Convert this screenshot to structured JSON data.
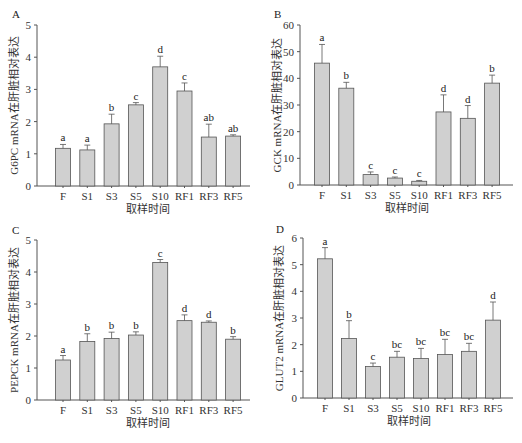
{
  "chart_data": [
    {
      "type": "bar",
      "panel": "A",
      "ylabel": "G6PC mRNA在肝脏相对表达",
      "xlabel": "取样时间",
      "ylim": [
        0,
        5
      ],
      "yticks": [
        0,
        1,
        2,
        3,
        4,
        5
      ],
      "categories": [
        "F",
        "S1",
        "S3",
        "S5",
        "S10",
        "RF1",
        "RF3",
        "RF5"
      ],
      "values": [
        1.17,
        1.12,
        1.93,
        2.52,
        3.7,
        2.95,
        1.52,
        1.55
      ],
      "errors": [
        0.12,
        0.15,
        0.3,
        0.07,
        0.33,
        0.25,
        0.4,
        0.04
      ],
      "significance": [
        "a",
        "a",
        "b",
        "c",
        "d",
        "c",
        "ab",
        "ab"
      ]
    },
    {
      "type": "bar",
      "panel": "B",
      "ylabel": "GCK mRNA在肝脏相对表达",
      "xlabel": "取样时间",
      "ylim": [
        0,
        60
      ],
      "yticks": [
        0,
        10,
        20,
        30,
        40,
        50,
        60
      ],
      "categories": [
        "F",
        "S1",
        "S3",
        "S5",
        "S10",
        "RF1",
        "RF3",
        "RF5"
      ],
      "values": [
        45.7,
        36.3,
        3.9,
        2.6,
        1.4,
        27.4,
        25.0,
        38.2
      ],
      "errors": [
        7.0,
        2.2,
        1.0,
        0.4,
        0.3,
        6.4,
        4.8,
        3.0
      ],
      "significance": [
        "a",
        "b",
        "c",
        "c",
        "c",
        "d",
        "d",
        "b"
      ]
    },
    {
      "type": "bar",
      "panel": "C",
      "ylabel": "PEPCK mRNA在肝脏相对表达",
      "xlabel": "取样时间",
      "ylim": [
        0,
        5
      ],
      "yticks": [
        0,
        1,
        2,
        3,
        4,
        5
      ],
      "categories": [
        "F",
        "S1",
        "S3",
        "S5",
        "S10",
        "RF1",
        "RF3",
        "RF5"
      ],
      "values": [
        1.25,
        1.83,
        1.92,
        2.03,
        4.3,
        2.48,
        2.43,
        1.9
      ],
      "errors": [
        0.14,
        0.24,
        0.2,
        0.1,
        0.09,
        0.18,
        0.04,
        0.08
      ],
      "significance": [
        "a",
        "b",
        "b",
        "b",
        "c",
        "d",
        "d",
        "b"
      ]
    },
    {
      "type": "bar",
      "panel": "D",
      "ylabel": "GLUT2 mRNA在肝脏相对表达",
      "xlabel": "取样时间",
      "ylim": [
        0,
        6
      ],
      "yticks": [
        0,
        1,
        2,
        3,
        4,
        5,
        6
      ],
      "categories": [
        "F",
        "S1",
        "S3",
        "S5",
        "S10",
        "RF1",
        "RF3",
        "RF5"
      ],
      "values": [
        5.22,
        2.23,
        1.18,
        1.53,
        1.48,
        1.63,
        1.75,
        2.92
      ],
      "errors": [
        0.42,
        0.67,
        0.13,
        0.22,
        0.38,
        0.57,
        0.3,
        0.68
      ],
      "significance": [
        "a",
        "b",
        "c",
        "bc",
        "bc",
        "bc",
        "bc",
        "d"
      ]
    }
  ],
  "colors": {
    "bar_fill": "#d0d0d0",
    "bar_stroke": "#555555",
    "axis": "#555555"
  }
}
